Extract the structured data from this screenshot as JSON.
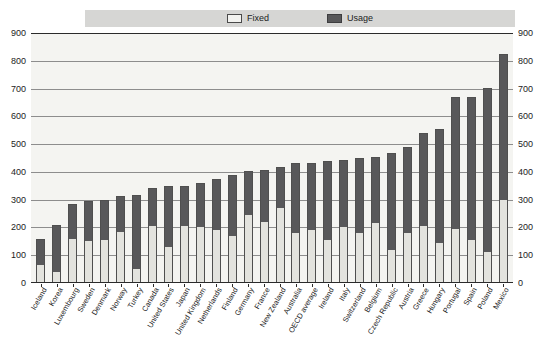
{
  "legend": {
    "position": "top-center",
    "items": [
      {
        "label": "Fixed",
        "color": "#e3e3de",
        "swatch": "fixed-swatch"
      },
      {
        "label": "Usage",
        "color": "#58585a",
        "swatch": "usage-swatch"
      }
    ]
  },
  "axis": {
    "y_ticks": [
      "900",
      "800",
      "700",
      "600",
      "500",
      "400",
      "300",
      "200",
      "100",
      "0"
    ],
    "y_ticks_right": [
      "900",
      "800",
      "700",
      "600",
      "500",
      "400",
      "300",
      "200",
      "100",
      "0"
    ]
  },
  "chart_data": {
    "type": "bar",
    "subtype": "stacked-vertical",
    "title": "",
    "subtitle": "",
    "xlabel": "",
    "ylabel": "",
    "ylim": [
      0,
      900
    ],
    "ystep": 100,
    "grid": true,
    "legend_position": "top-center",
    "categories": [
      "Iceland",
      "Korea",
      "Luxembourg",
      "Sweden",
      "Denmark",
      "Norway",
      "Turkey",
      "Canada",
      "United States",
      "Japan",
      "United Kingdom",
      "Netherlands",
      "Finland",
      "Germany",
      "France",
      "New Zealand",
      "Australia",
      "OECD average",
      "Ireland",
      "Italy",
      "Switzerland",
      "Belgium",
      "Czech Republic",
      "Austria",
      "Greece",
      "Hungary",
      "Portugal",
      "Spain",
      "Poland",
      "Mexico"
    ],
    "series": [
      {
        "name": "Fixed",
        "color": "#e3e3de",
        "values": [
          65,
          40,
          160,
          150,
          155,
          185,
          50,
          205,
          130,
          205,
          200,
          190,
          170,
          245,
          220,
          270,
          180,
          190,
          155,
          200,
          180,
          215,
          120,
          180,
          205,
          145,
          195,
          155,
          110,
          300
        ]
      },
      {
        "name": "Usage",
        "color": "#58585a",
        "values": [
          90,
          165,
          120,
          140,
          140,
          125,
          265,
          135,
          215,
          140,
          155,
          180,
          215,
          155,
          185,
          145,
          250,
          240,
          280,
          240,
          265,
          235,
          345,
          305,
          330,
          405,
          470,
          510,
          590,
          520
        ]
      }
    ],
    "totals": [
      155,
      205,
      280,
      290,
      295,
      310,
      315,
      340,
      345,
      345,
      355,
      370,
      385,
      400,
      405,
      415,
      430,
      430,
      435,
      440,
      445,
      450,
      465,
      485,
      535,
      550,
      665,
      665,
      700,
      820
    ]
  }
}
